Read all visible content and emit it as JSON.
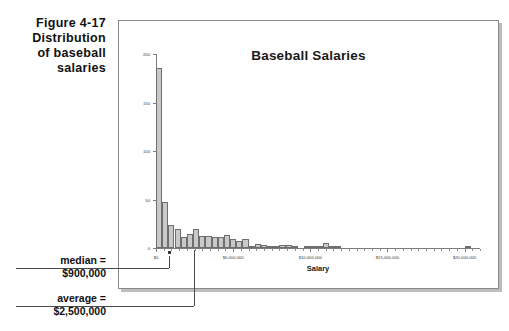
{
  "figure": {
    "caption_lines": [
      "Figure 4-17",
      "Distribution",
      "of baseball",
      "salaries"
    ]
  },
  "annotations": {
    "median": {
      "label": "median =",
      "value": "$900,000"
    },
    "average": {
      "label": "average =",
      "value": "$2,500,000"
    }
  },
  "chart_data": {
    "type": "bar",
    "title": "Baseball Salaries",
    "xlabel": "Salary",
    "ylabel": "",
    "xlim": [
      0,
      21000000
    ],
    "ylim": [
      0,
      200
    ],
    "grid": false,
    "legend": null,
    "ytick_labels": [
      "0",
      "50",
      "100",
      "150",
      "200"
    ],
    "ytick_values": [
      0,
      50,
      100,
      150,
      200
    ],
    "xtick_labels": [
      "$0",
      "$5,000,000",
      "$10,000,000",
      "$15,000,000",
      "$20,000,000"
    ],
    "xtick_values": [
      0,
      5000000,
      10000000,
      15000000,
      20000000
    ],
    "bin_width": 400000,
    "bin_starts": [
      0,
      400000,
      800000,
      1200000,
      1600000,
      2000000,
      2400000,
      2800000,
      3200000,
      3600000,
      4000000,
      4400000,
      4800000,
      5200000,
      5600000,
      6000000,
      6400000,
      6800000,
      7200000,
      7600000,
      8000000,
      8400000,
      8800000,
      9200000,
      9600000,
      10000000,
      10400000,
      10800000,
      11200000,
      11600000,
      12000000,
      12400000,
      12800000,
      13200000,
      13600000,
      14000000,
      14400000,
      14800000,
      15200000,
      15600000,
      16000000,
      16400000,
      16800000,
      17200000,
      17600000,
      18000000,
      18400000,
      18800000,
      19200000,
      19600000,
      20000000
    ],
    "values": [
      186,
      47,
      24,
      20,
      11,
      14,
      20,
      12,
      12,
      11,
      11,
      13,
      9,
      7,
      9,
      2,
      4,
      3,
      2,
      2,
      3,
      3,
      1,
      0,
      1,
      1,
      1,
      5,
      2,
      1,
      0,
      0,
      0,
      0,
      0,
      0,
      0,
      0,
      0,
      0,
      0,
      0,
      0,
      0,
      0,
      0,
      0,
      0,
      0,
      0,
      2
    ],
    "median": 900000,
    "average": 2500000
  },
  "colors": {
    "bar_fill": "#c9c9c9",
    "bar_edge": "#6e6e6e",
    "axis": "#7d7d7d",
    "text": "#111111",
    "frame": "#8a8a8a",
    "shadow": "#bdbdbd"
  }
}
